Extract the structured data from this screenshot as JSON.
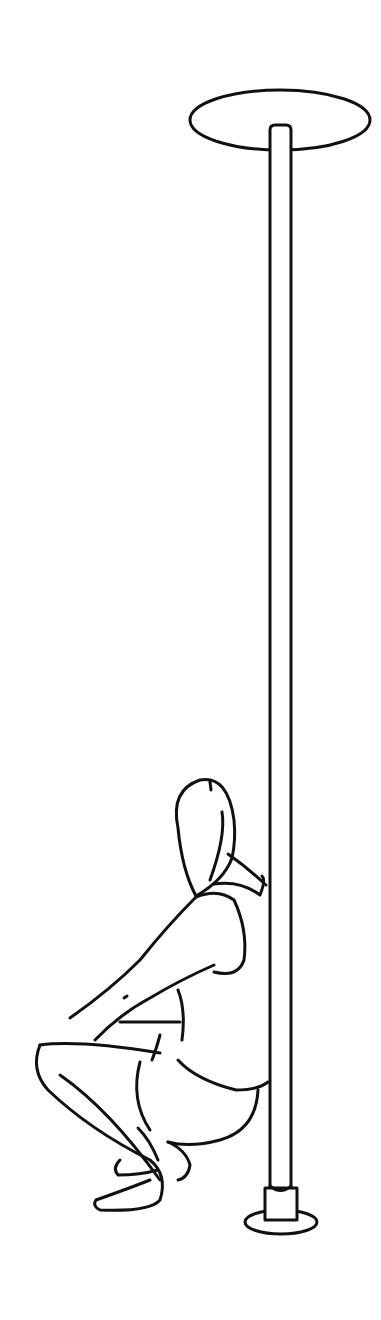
{
  "illustration": {
    "subject": "person squatting beside vertical pole",
    "caption": "Line drawing: squat at base of pole",
    "stroke_color": "#111111",
    "background_color": "#ffffff",
    "elements": {
      "top_mount": "ceiling disc",
      "pole": "vertical pole",
      "base_mount": "floor base",
      "figure": "squatting figure"
    }
  }
}
